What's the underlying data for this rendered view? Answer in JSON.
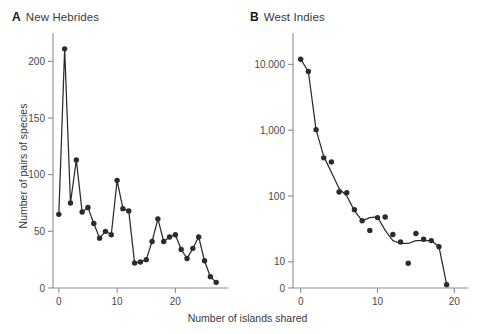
{
  "figure": {
    "width": 495,
    "height": 334,
    "background": "#ffffff",
    "ink_color": "#2b2b2b",
    "axis_color": "#8c8c8c",
    "text_color": "#3a3a3a",
    "shared_xlabel": "Number of islands shared"
  },
  "panels": {
    "a": {
      "letter": "A",
      "title": "New Hebrides",
      "ylabel": "Number of pairs of species"
    },
    "b": {
      "letter": "B",
      "title": "West Indies",
      "ylabel": ""
    }
  },
  "chart_data": [
    {
      "id": "panel-a",
      "type": "line",
      "title": "New Hebrides",
      "panel_letter": "A",
      "xlabel": "Number of islands shared",
      "ylabel": "Number of pairs of species",
      "xscale": "linear",
      "yscale": "linear",
      "xlim": [
        -1,
        28
      ],
      "ylim": [
        0,
        225
      ],
      "xticks": [
        0,
        10,
        20
      ],
      "xtick_labels": [
        "0",
        "10",
        "20"
      ],
      "yticks": [
        0,
        50,
        100,
        150,
        200
      ],
      "ytick_labels": [
        "0",
        "50",
        "100",
        "150",
        "200"
      ],
      "grid": false,
      "legend": false,
      "marker": "filled-circle",
      "x": [
        0,
        1,
        2,
        3,
        4,
        5,
        6,
        7,
        8,
        9,
        10,
        11,
        12,
        13,
        14,
        15,
        16,
        17,
        18,
        19,
        20,
        21,
        22,
        23,
        24,
        25,
        26,
        27
      ],
      "values": [
        65,
        211,
        75,
        113,
        67,
        71,
        57,
        44,
        50,
        47,
        95,
        70,
        68,
        22,
        23,
        25,
        41,
        61,
        41,
        45,
        47,
        34,
        26,
        35,
        45,
        24,
        10,
        5
      ]
    },
    {
      "id": "panel-b",
      "type": "line",
      "title": "West Indies",
      "panel_letter": "B",
      "xlabel": "Number of islands shared",
      "ylabel": "",
      "xscale": "linear",
      "yscale": "log",
      "xlim": [
        -1,
        21
      ],
      "ylim": [
        4,
        30000
      ],
      "xticks": [
        0,
        10,
        20
      ],
      "xtick_labels": [
        "0",
        "10",
        "20"
      ],
      "yticks": [
        10,
        100,
        1000,
        10000
      ],
      "ytick_labels": [
        "10",
        "100",
        "1,000",
        "10.000"
      ],
      "y_axis_zero_label": "0",
      "grid": false,
      "legend": false,
      "marker": "filled-circle",
      "x": [
        0,
        1,
        2,
        3,
        4,
        5,
        6,
        7,
        8,
        9,
        10,
        11,
        12,
        13,
        14,
        15,
        16,
        17,
        18,
        19
      ],
      "values": [
        12000,
        7800,
        1020,
        380,
        330,
        115,
        112,
        62,
        42,
        30,
        47,
        48,
        26,
        20,
        9.5,
        27,
        22,
        21,
        17,
        4.5
      ],
      "fitted_curve": {
        "name": "smoothed trend",
        "x": [
          0,
          1,
          2,
          3,
          4,
          5,
          6,
          7,
          8,
          9,
          10,
          11,
          12,
          13,
          14,
          15,
          16,
          17,
          18,
          19
        ],
        "values": [
          12000,
          7800,
          1020,
          400,
          230,
          130,
          100,
          60,
          42,
          47,
          48,
          30,
          21,
          19,
          19,
          21,
          21,
          21,
          17,
          4.5
        ]
      }
    }
  ]
}
